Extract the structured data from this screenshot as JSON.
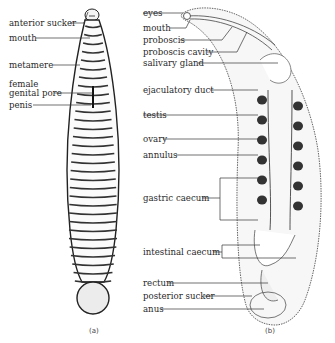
{
  "figure": {
    "panels": [
      {
        "caption": "(a)",
        "view": "external dorsal view",
        "labels": [
          {
            "id": "anterior-sucker",
            "text": "anterior sucker"
          },
          {
            "id": "mouth",
            "text": "mouth"
          },
          {
            "id": "metamere",
            "text": "metamere"
          },
          {
            "id": "female-genital-pore-1",
            "text": "female"
          },
          {
            "id": "female-genital-pore-2",
            "text": "genital pore"
          },
          {
            "id": "penis",
            "text": "penis"
          }
        ]
      },
      {
        "caption": "(b)",
        "view": "internal anatomy",
        "labels": [
          {
            "id": "eyes",
            "text": "eyes"
          },
          {
            "id": "mouth",
            "text": "mouth"
          },
          {
            "id": "proboscis",
            "text": "proboscis"
          },
          {
            "id": "proboscis-cavity",
            "text": "proboscis cavity"
          },
          {
            "id": "salivary-gland",
            "text": "salivary gland"
          },
          {
            "id": "ejaculatory-duct",
            "text": "ejaculatory duct"
          },
          {
            "id": "testis",
            "text": "testis"
          },
          {
            "id": "ovary",
            "text": "ovary"
          },
          {
            "id": "annulus",
            "text": "annulus"
          },
          {
            "id": "gastric-caecum",
            "text": "gastric caecum"
          },
          {
            "id": "intestinal-caecum",
            "text": "intestinal caecum"
          },
          {
            "id": "rectum",
            "text": "rectum"
          },
          {
            "id": "posterior-sucker",
            "text": "posterior sucker"
          },
          {
            "id": "anus",
            "text": "anus"
          }
        ]
      }
    ]
  }
}
